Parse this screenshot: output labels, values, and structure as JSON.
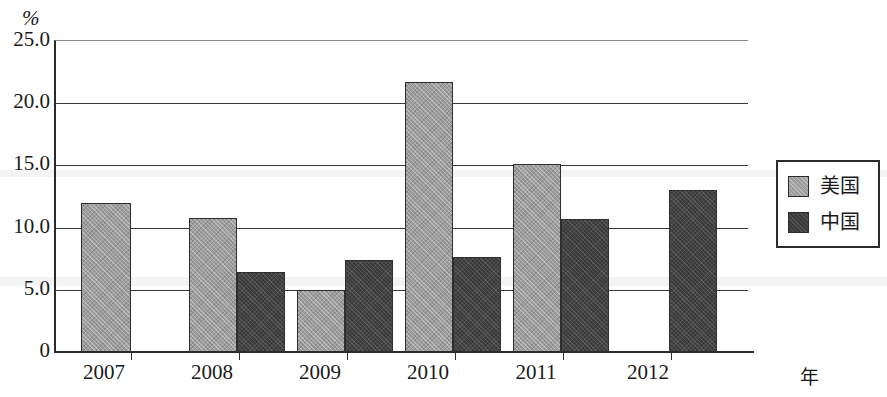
{
  "chart_data": {
    "type": "bar",
    "title": "",
    "subtitle": "",
    "xlabel": "年",
    "ylabel": "%",
    "categories": [
      "2007",
      "2008",
      "2009",
      "2010",
      "2011",
      "2012"
    ],
    "series": [
      {
        "name": "美国",
        "color": "#9d9d9d",
        "values": [
          12.0,
          10.8,
          5.0,
          21.7,
          15.1,
          null
        ]
      },
      {
        "name": "中国",
        "color": "#3a3a3a",
        "values": [
          null,
          6.4,
          7.4,
          7.6,
          10.7,
          13.0
        ]
      }
    ],
    "ylim": [
      0,
      25
    ],
    "ytick_labels": [
      "25.0",
      "20.0",
      "15.0",
      "10.0",
      "5.0",
      "0"
    ],
    "ytick_values": [
      25.0,
      20.0,
      15.0,
      10.0,
      5.0,
      0
    ],
    "grid": true,
    "legend_position": "right"
  },
  "axes": {
    "unit_label": "%",
    "x_axis_name": "年"
  },
  "legend": {
    "items": [
      {
        "label": "美国",
        "swatch": "us-swatch"
      },
      {
        "label": "中国",
        "swatch": "cn-swatch"
      }
    ]
  }
}
